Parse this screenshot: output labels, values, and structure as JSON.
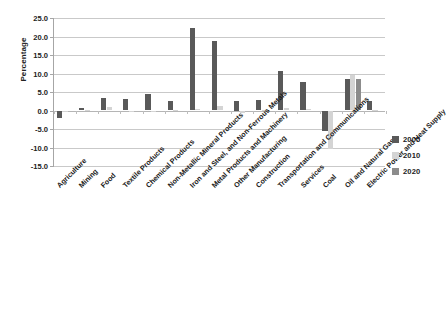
{
  "chart_data": {
    "type": "bar",
    "title": "",
    "xlabel": "",
    "ylabel": "Percentage",
    "ylim": [
      -15.0,
      25.0
    ],
    "ytick_labels": [
      "25.0",
      "20.0",
      "15.0",
      "10.0",
      "5.0",
      "0.0",
      "-5.0",
      "-10.0",
      "-15.0"
    ],
    "ytick_values": [
      25.0,
      20.0,
      15.0,
      10.0,
      5.0,
      0.0,
      -5.0,
      -10.0,
      -15.0
    ],
    "grid": true,
    "legend_position": "right",
    "categories": [
      "Agriculture",
      "Mining",
      "Food",
      "Textile Products",
      "Chemical Products",
      "Non-Metallic Mineral Products",
      "Iron and Steel, and Non-Ferrous Metals",
      "Metal Products and Machinery",
      "Other Manufacturing",
      "Construction",
      "Transportation and Communications",
      "Services",
      "Coal",
      "Oil and Natural Gas",
      "Electric Power and Heat Supply"
    ],
    "series": [
      {
        "name": "2005",
        "color": "#595959",
        "values": [
          -2.0,
          0.6,
          3.4,
          3.0,
          4.4,
          2.6,
          22.3,
          18.7,
          2.5,
          2.9,
          10.8,
          7.8,
          -5.5,
          8.4,
          2.6
        ]
      },
      {
        "name": "2010",
        "color": "#d4d4d4",
        "values": [
          -0.3,
          0.1,
          1.0,
          -0.3,
          -0.4,
          0.1,
          0.3,
          1.1,
          -0.6,
          0.2,
          0.6,
          0.5,
          -10.5,
          9.7,
          0.2
        ]
      },
      {
        "name": "2020",
        "color": "#8c8c8c",
        "values": [
          0.0,
          0.0,
          0.0,
          0.0,
          0.0,
          0.0,
          0.0,
          0.0,
          0.0,
          0.0,
          0.0,
          0.0,
          0.0,
          8.4,
          0.0
        ]
      }
    ]
  },
  "legend": {
    "items": [
      {
        "label": "2005",
        "color": "#595959"
      },
      {
        "label": "2010",
        "color": "#d4d4d4"
      },
      {
        "label": "2020",
        "color": "#8c8c8c"
      }
    ]
  }
}
